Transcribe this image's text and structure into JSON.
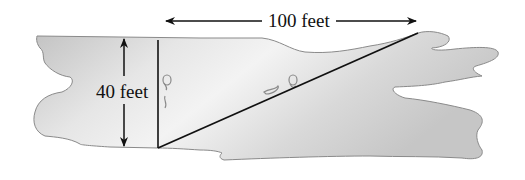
{
  "diagram": {
    "type": "river-crossing-geometry",
    "labels": {
      "width": "40 feet",
      "downstream": "100 feet"
    },
    "colors": {
      "river_fill_dark": "#bdbdbd",
      "river_fill_light": "#f2f2f2",
      "river_outline": "#8a8a8a",
      "line": "#111111",
      "background": "#ffffff"
    },
    "elements": [
      {
        "name": "river",
        "kind": "shape"
      },
      {
        "name": "width-arrow",
        "kind": "double-arrow",
        "label": "40 feet"
      },
      {
        "name": "downstream-arrow",
        "kind": "double-arrow",
        "label": "100 feet"
      },
      {
        "name": "perpendicular-line",
        "kind": "line"
      },
      {
        "name": "diagonal-path",
        "kind": "line"
      },
      {
        "name": "footprints",
        "kind": "decoration"
      }
    ]
  }
}
